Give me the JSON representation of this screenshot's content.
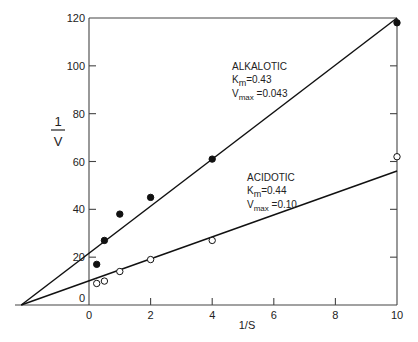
{
  "chart_data": {
    "type": "scatter",
    "title": "",
    "xlabel": "1/S",
    "ylabel": "1/V",
    "xlim": [
      -2.3,
      10
    ],
    "ylim": [
      0,
      120
    ],
    "xticks": [
      0,
      2,
      4,
      6,
      8,
      10
    ],
    "yticks": [
      0,
      20,
      40,
      60,
      80,
      100,
      120
    ],
    "grid": false,
    "series": [
      {
        "name": "ALKALOTIC",
        "marker": "filled-circle",
        "km_label": "0.43",
        "vmax_label": "0.043",
        "x": [
          0.25,
          0.5,
          1,
          2,
          4,
          10
        ],
        "y": [
          17,
          27,
          38,
          45,
          61,
          118
        ],
        "fit_line": {
          "x": [
            -2.2,
            10
          ],
          "y": [
            0,
            122
          ]
        }
      },
      {
        "name": "ACIDOTIC",
        "marker": "open-circle",
        "km_label": "0.44",
        "vmax_label": "0.10",
        "x": [
          0.25,
          0.5,
          1,
          2,
          4,
          10
        ],
        "y": [
          9,
          10,
          14,
          19,
          27,
          62
        ],
        "fit_line": {
          "x": [
            -2.2,
            10
          ],
          "y": [
            0,
            56
          ]
        }
      }
    ],
    "annotations": [
      {
        "series": "ALKALOTIC",
        "lines": [
          "ALKALOTIC",
          "Km=0.43",
          "Vmax =0.043"
        ]
      },
      {
        "series": "ACIDOTIC",
        "lines": [
          "ACIDOTIC",
          "Km=0.44",
          "Vmax =0.10"
        ]
      }
    ]
  },
  "labels": {
    "xlabel": "1/S",
    "ylabel_num": "1",
    "ylabel_den": "V",
    "alk_name": "ALKALOTIC",
    "alk_km_sym": "K",
    "alk_km_sub": "m",
    "alk_km_val": "=0.43",
    "alk_vmax_sym": "V",
    "alk_vmax_sub": "max",
    "alk_vmax_val": " =0.043",
    "acid_name": "ACIDOTIC",
    "acid_km_sym": "K",
    "acid_km_sub": "m",
    "acid_km_val": "=0.44",
    "acid_vmax_sym": "V",
    "acid_vmax_sub": "max",
    "acid_vmax_val": " =0.10"
  }
}
